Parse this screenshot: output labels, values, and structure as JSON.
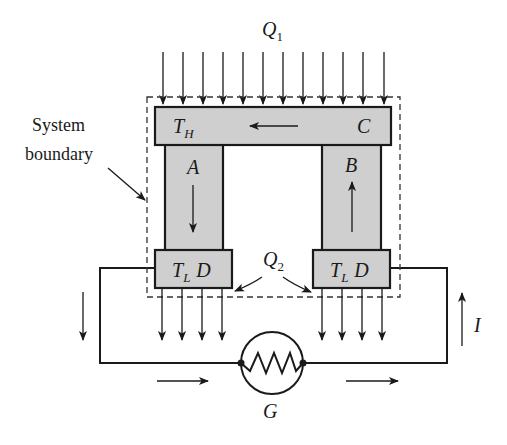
{
  "diagram": {
    "type": "thermoelectric-generator-schematic",
    "labels": {
      "heat_in": "Q",
      "heat_in_sub": "1",
      "heat_out": "Q",
      "heat_out_sub": "2",
      "system_boundary_line1": "System",
      "system_boundary_line2": "boundary",
      "hot_temp": "T",
      "hot_temp_sub": "H",
      "hot_junction": "C",
      "leg_a": "A",
      "leg_b": "B",
      "cold_temp_left": "T",
      "cold_temp_left_sub": "L",
      "cold_junction_left": "D",
      "cold_temp_right": "T",
      "cold_temp_right_sub": "L",
      "cold_junction_right": "D",
      "current": "I",
      "generator": "G"
    },
    "components": [
      {
        "id": "hot-block",
        "label": "T_H  C",
        "flow_arrow": "left"
      },
      {
        "id": "leg-a",
        "label": "A",
        "flow_arrow": "down"
      },
      {
        "id": "leg-b",
        "label": "B",
        "flow_arrow": "up"
      },
      {
        "id": "cold-block-left",
        "label": "T_L D"
      },
      {
        "id": "cold-block-right",
        "label": "T_L D"
      },
      {
        "id": "load-resistor",
        "label": "G"
      }
    ],
    "heat_in_arrow_count": 12,
    "heat_out_arrow_count_per_block": 4,
    "colors": {
      "block_fill": "#cfcfcf",
      "line": "#1a1a1a",
      "background": "#ffffff"
    }
  }
}
